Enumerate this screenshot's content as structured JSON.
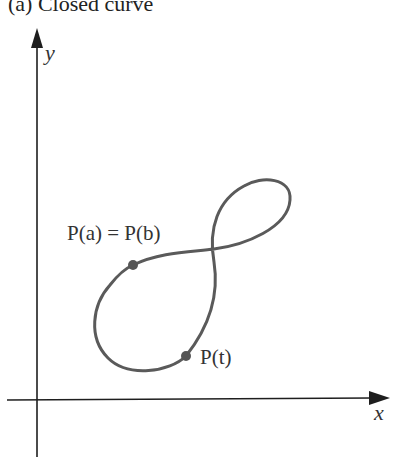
{
  "figure": {
    "title": "(a) Closed curve",
    "axes": {
      "x_label": "x",
      "y_label": "y"
    },
    "points": [
      {
        "id": "start_end",
        "label": "P(a) = P(b)"
      },
      {
        "id": "moving",
        "label": "P(t)"
      }
    ],
    "colors": {
      "axis": "#1e1e1e",
      "curve": "#5a5a5a",
      "point": "#555555",
      "text": "#333333"
    }
  }
}
